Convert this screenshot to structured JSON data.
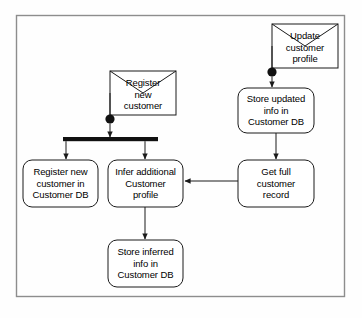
{
  "diagram": {
    "type": "uml-activity-diagram",
    "frame": {
      "x": 16,
      "y": 15,
      "width": 329,
      "height": 282,
      "border_color": "#888888",
      "background": "#fefefe"
    },
    "stroke_color": "#1a1a1a",
    "signals": [
      {
        "id": "signal-update-customer-profile",
        "shape": "envelope",
        "lines": [
          "Update",
          "customer",
          "profile"
        ],
        "x": 272,
        "y": 24,
        "width": 66,
        "height": 44
      },
      {
        "id": "signal-register-new-customer",
        "shape": "envelope",
        "lines": [
          "Register",
          "new",
          "customer"
        ],
        "x": 110,
        "y": 71,
        "width": 66,
        "height": 44
      }
    ],
    "initial_nodes": [
      {
        "id": "initial-node-update",
        "cx": 272,
        "cy": 72,
        "r": 4.5
      },
      {
        "id": "initial-node-register",
        "cx": 110,
        "cy": 119,
        "r": 4.5
      }
    ],
    "fork_bars": [
      {
        "id": "fork-bar-register",
        "x": 63,
        "y": 137,
        "width": 95,
        "height": 4
      }
    ],
    "activities": [
      {
        "id": "activity-store-updated-info",
        "lines": [
          "Store updated",
          "info in",
          "Customer DB"
        ],
        "x": 238,
        "y": 88,
        "width": 76,
        "height": 45
      },
      {
        "id": "activity-get-full-customer-record",
        "lines": [
          "Get full",
          "customer",
          "record"
        ],
        "x": 238,
        "y": 160,
        "width": 76,
        "height": 47
      },
      {
        "id": "activity-register-new-customer-in-db",
        "lines": [
          "Register new",
          "customer in",
          "Customer DB"
        ],
        "x": 23,
        "y": 160,
        "width": 75,
        "height": 47
      },
      {
        "id": "activity-infer-additional-customer-profile",
        "lines": [
          "Infer additional",
          "Customer",
          "profile"
        ],
        "x": 108,
        "y": 160,
        "width": 75,
        "height": 47
      },
      {
        "id": "activity-store-inferred-info",
        "lines": [
          "Store inferred",
          "info in",
          "Customer DB"
        ],
        "x": 108,
        "y": 240,
        "width": 75,
        "height": 47
      }
    ],
    "edges": [
      {
        "id": "edge-update-signal-to-initial",
        "from": "signal-update-customer-profile",
        "to": "initial-node-update",
        "arrow": false
      },
      {
        "id": "edge-initial-to-store-updated",
        "from": "initial-node-update",
        "to": "activity-store-updated-info",
        "arrow": true
      },
      {
        "id": "edge-store-updated-to-get-full",
        "from": "activity-store-updated-info",
        "to": "activity-get-full-customer-record",
        "arrow": true
      },
      {
        "id": "edge-get-full-to-infer",
        "from": "activity-get-full-customer-record",
        "to": "activity-infer-additional-customer-profile",
        "arrow": true
      },
      {
        "id": "edge-register-signal-to-initial",
        "from": "signal-register-new-customer",
        "to": "initial-node-register",
        "arrow": false
      },
      {
        "id": "edge-initial-to-fork",
        "from": "initial-node-register",
        "to": "fork-bar-register",
        "arrow": true
      },
      {
        "id": "edge-fork-to-register-db",
        "from": "fork-bar-register",
        "to": "activity-register-new-customer-in-db",
        "arrow": true
      },
      {
        "id": "edge-fork-to-infer",
        "from": "fork-bar-register",
        "to": "activity-infer-additional-customer-profile",
        "arrow": true
      },
      {
        "id": "edge-infer-to-store-inferred",
        "from": "activity-infer-additional-customer-profile",
        "to": "activity-store-inferred-info",
        "arrow": true
      }
    ]
  }
}
